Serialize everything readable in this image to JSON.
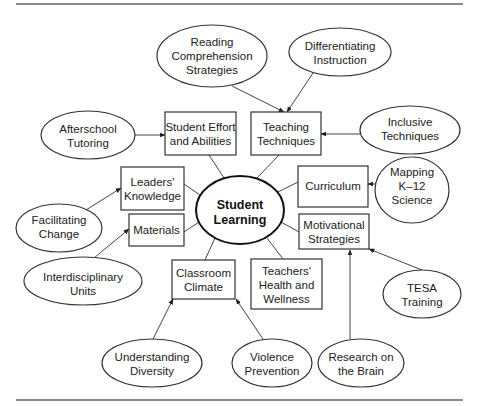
{
  "diagram": {
    "center": {
      "id": "student-learning",
      "lines": [
        "Student",
        "Learning"
      ]
    },
    "factors": [
      {
        "id": "student-effort",
        "lines": [
          "Student Effort",
          "and Abilities"
        ]
      },
      {
        "id": "teaching-techniques",
        "lines": [
          "Teaching",
          "Techniques"
        ]
      },
      {
        "id": "leaders-knowledge",
        "lines": [
          "Leaders'",
          "Knowledge"
        ]
      },
      {
        "id": "curriculum",
        "lines": [
          "Curriculum"
        ]
      },
      {
        "id": "materials",
        "lines": [
          "Materials"
        ]
      },
      {
        "id": "motivational-strategies",
        "lines": [
          "Motivational",
          "Strategies"
        ]
      },
      {
        "id": "classroom-climate",
        "lines": [
          "Classroom",
          "Climate"
        ]
      },
      {
        "id": "teachers-health",
        "lines": [
          "Teachers'",
          "Health and",
          "Wellness"
        ]
      }
    ],
    "initiatives": [
      {
        "id": "reading-comprehension",
        "lines": [
          "Reading",
          "Comprehension",
          "Strategies"
        ],
        "target": "teaching-techniques"
      },
      {
        "id": "differentiating-instruction",
        "lines": [
          "Differentiating",
          "Instruction"
        ],
        "target": "teaching-techniques"
      },
      {
        "id": "afterschool-tutoring",
        "lines": [
          "Afterschool",
          "Tutoring"
        ],
        "target": "student-effort"
      },
      {
        "id": "inclusive-techniques",
        "lines": [
          "Inclusive",
          "Techniques"
        ],
        "target": "teaching-techniques"
      },
      {
        "id": "mapping-k12",
        "lines": [
          "Mapping",
          "K–12",
          "Science"
        ],
        "target": "curriculum"
      },
      {
        "id": "facilitating-change",
        "lines": [
          "Facilitating",
          "Change"
        ],
        "target": "leaders-knowledge"
      },
      {
        "id": "interdisciplinary-units",
        "lines": [
          "Interdisciplinary",
          "Units"
        ],
        "target": "materials"
      },
      {
        "id": "tesa-training",
        "lines": [
          "TESA",
          "Training"
        ],
        "target": "motivational-strategies"
      },
      {
        "id": "understanding-diversity",
        "lines": [
          "Understanding",
          "Diversity"
        ],
        "target": "classroom-climate"
      },
      {
        "id": "violence-prevention",
        "lines": [
          "Violence",
          "Prevention"
        ],
        "target": "classroom-climate"
      },
      {
        "id": "research-brain",
        "lines": [
          "Research on",
          "the Brain"
        ],
        "target": "motivational-strategies"
      }
    ]
  }
}
